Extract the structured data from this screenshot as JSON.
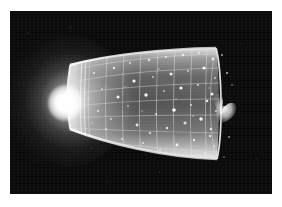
{
  "figure": {
    "medium": "grayscale astronomical illustration",
    "background_color": "#0a0a0a",
    "frame": {
      "left": 10,
      "top": 11,
      "width": 262,
      "height": 183,
      "border_color": "#ffffff",
      "page_background": "#ffffff"
    },
    "caption": "",
    "credit": ""
  },
  "scene": {
    "objects": [
      {
        "name": "big-bang-glow",
        "label": "Big Bang",
        "description": "intense white light source at the narrow apex of the cone",
        "color": "#ffffff",
        "center_x": 58,
        "center_y": 97,
        "radius": 34
      },
      {
        "name": "spacetime-cone",
        "label": "Expanding spacetime cone",
        "description": "translucent funnel widening left to right, wireframe grid surface",
        "color": "#d8d8d8",
        "narrow_end_x": 70,
        "wide_end_x": 218,
        "narrow_height": 62,
        "wide_height": 110
      },
      {
        "name": "grid-mesh",
        "label": "Coordinate grid",
        "description": "latitude and longitude mesh lines mapped over the cone surface",
        "color": "#e8e8e8",
        "columns": 9,
        "rows": 7
      },
      {
        "name": "galaxy-points",
        "label": "Galaxies",
        "description": "bright white dots scattered across the cone surface, denser toward the wide end",
        "color": "#ffffff",
        "count": 78
      },
      {
        "name": "butterfly-galaxy",
        "label": "Foreground galaxy",
        "description": "butterfly / winged-shaped bright object near the wide rim",
        "color": "#f0f0f0",
        "center_x": 222,
        "center_y": 102
      }
    ]
  },
  "colors": {
    "sky": "#0a0a0a",
    "cone_fill": "#b8b8b8",
    "cone_edge": "#f2f2f2",
    "grid": "#dcdcdc",
    "star": "#ffffff",
    "glow": "#ffffff",
    "page": "#ffffff"
  }
}
